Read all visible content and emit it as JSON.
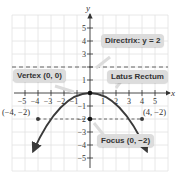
{
  "diagram": {
    "type": "parabola-graph",
    "equation_implied": "x^2 = -8y",
    "axes": {
      "x_label": "x",
      "y_label": "y",
      "x_ticks": [
        "-5",
        "-4",
        "-3",
        "-2",
        "-1",
        "1",
        "2",
        "3",
        "4",
        "5"
      ],
      "y_ticks": [
        "5",
        "4",
        "3",
        "2",
        "1",
        "-1",
        "-2",
        "-3",
        "-4",
        "-5"
      ],
      "xlim": [
        -6,
        6
      ],
      "ylim": [
        -6,
        6
      ]
    },
    "labels": {
      "directrix": "Directrix: y = 2",
      "vertex": "Vertex (0, 0)",
      "latus_rectum": "Latus Rectum",
      "focus": "Focus (0, −2)",
      "point_left": "(−4, −2)",
      "point_right": "(4, −2)"
    },
    "points": [
      {
        "name": "vertex",
        "x": 0,
        "y": 0
      },
      {
        "name": "focus",
        "x": 0,
        "y": -2
      },
      {
        "name": "latus-left",
        "x": -4,
        "y": -2
      },
      {
        "name": "latus-right",
        "x": 4,
        "y": -2
      }
    ],
    "lines": [
      {
        "name": "directrix",
        "y": 2,
        "style": "dashed"
      },
      {
        "name": "latus-rectum",
        "y": -2,
        "style": "dashed"
      }
    ],
    "colors": {
      "curve": "#3a3a3a",
      "grid": "#e2e2e2",
      "axis": "#333333",
      "label_bg": "#dcdcdc"
    }
  }
}
